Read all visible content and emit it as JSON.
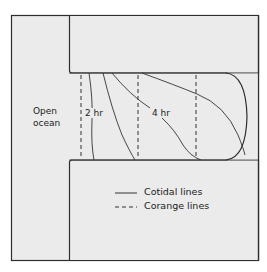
{
  "diagram": {
    "colors": {
      "background": "#ebebeb",
      "outline": "#2e2e2e",
      "line": "#333333"
    },
    "labels": {
      "open_ocean_line1": "Open",
      "open_ocean_line2": "ocean",
      "hour2": "2 hr",
      "hour4": "4 hr"
    },
    "legend": [
      {
        "style": "solid",
        "label": "Cotidal lines"
      },
      {
        "style": "dashed",
        "label": "Corange lines"
      }
    ]
  }
}
